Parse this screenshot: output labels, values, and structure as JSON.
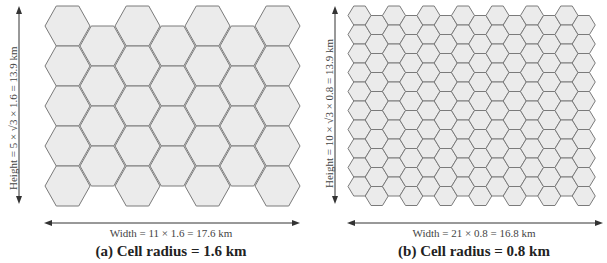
{
  "panels": [
    {
      "id": "a",
      "caption": "(a) Cell radius = 1.6 km",
      "width_label": "Width = 11 × 1.6 = 17.6 km",
      "height_label": "Height = 5 × √3 × 1.6 = 13.9 km",
      "cell_radius_km": 1.6,
      "grid": {
        "columns": 7,
        "rows_even_col": 5,
        "rows_odd_col": 4,
        "origin_x": 45,
        "origin_y": 6,
        "hex_half_width": 22.5,
        "hex_half_height": 20,
        "col_step": 35
      }
    },
    {
      "id": "b",
      "caption": "(b) Cell radius = 0.8 km",
      "width_label": "Width = 21 × 0.8 = 16.8 km",
      "height_label": "Height = 10 × √3 × 0.8 = 13.9 km",
      "cell_radius_km": 0.8,
      "grid": {
        "columns": 14,
        "rows_even_col": 10,
        "rows_odd_col": 10,
        "origin_x": 45,
        "origin_y": 6,
        "hex_half_width": 11.5,
        "hex_half_height": 9.5,
        "col_step": 17.25
      }
    }
  ],
  "colors": {
    "cell_fill": "#ebebeb",
    "cell_stroke": "#7a7a7a",
    "arrow": "#333333"
  }
}
